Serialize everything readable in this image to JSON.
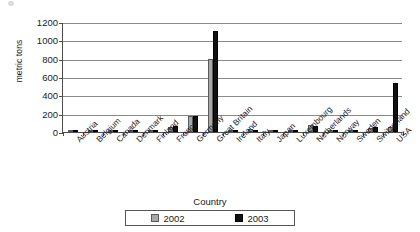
{
  "chart_data": {
    "type": "bar",
    "title": "",
    "xlabel": "Country",
    "ylabel": "metric tons",
    "ylim": [
      0,
      1200
    ],
    "ytick_step": 200,
    "yticks": [
      0,
      200,
      400,
      600,
      800,
      1000,
      1200
    ],
    "grid": true,
    "legend_position": "bottom",
    "categories": [
      "Austria",
      "Belgium",
      "Canada",
      "Denmark",
      "Finland",
      "France",
      "Germany",
      "Great Britain",
      "Ireland",
      "Italy",
      "Japan",
      "Luxembourg",
      "Netherlands",
      "Norway",
      "Sweden",
      "Switzerland",
      "USA"
    ],
    "series": [
      {
        "name": "2002",
        "color": "#a8a8a8",
        "values": [
          2,
          2,
          5,
          20,
          3,
          55,
          170,
          800,
          5,
          30,
          8,
          2,
          75,
          3,
          15,
          45,
          50
        ]
      },
      {
        "name": "2003",
        "color": "#111111",
        "values": [
          3,
          2,
          5,
          18,
          3,
          70,
          170,
          1100,
          5,
          25,
          5,
          2,
          70,
          3,
          12,
          50,
          530
        ]
      }
    ]
  },
  "axis": {
    "y_title": "metric tons",
    "x_title": "Country"
  }
}
